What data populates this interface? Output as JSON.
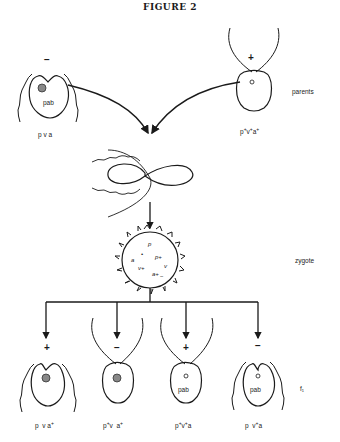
{
  "figure": {
    "title": "FIGURE 2",
    "row_labels": {
      "parents": "parents",
      "zygote": "zygote",
      "f1": "f₁"
    },
    "parents": [
      {
        "sign": "−",
        "inner_label": "pab",
        "genotype_html": "p v a"
      },
      {
        "sign": "+",
        "inner_label": "o",
        "genotype_html": "p<sup>+</sup>v<sup>+</sup>a<sup>+</sup>"
      }
    ],
    "zygote_contents": [
      "p",
      "a",
      "p+",
      "v",
      "v+",
      "a+",
      "−",
      "+"
    ],
    "offspring": [
      {
        "sign": "+",
        "inner_label": "",
        "genotype_html": "p&nbsp; v a<sup>+</sup>"
      },
      {
        "sign": "−",
        "inner_label": "",
        "genotype_html": "p<sup>+</sup>v&nbsp; a<sup>+</sup>"
      },
      {
        "sign": "+",
        "inner_label": "o pab",
        "genotype_html": "p<sup>+</sup>v<sup>+</sup>a"
      },
      {
        "sign": "−",
        "inner_label": "o pab",
        "genotype_html": "p&nbsp; v<sup>+</sup>a"
      }
    ],
    "caption_partial": "...  . . . . .   . . . . .   .  . . .  .  .  .  .  ."
  }
}
